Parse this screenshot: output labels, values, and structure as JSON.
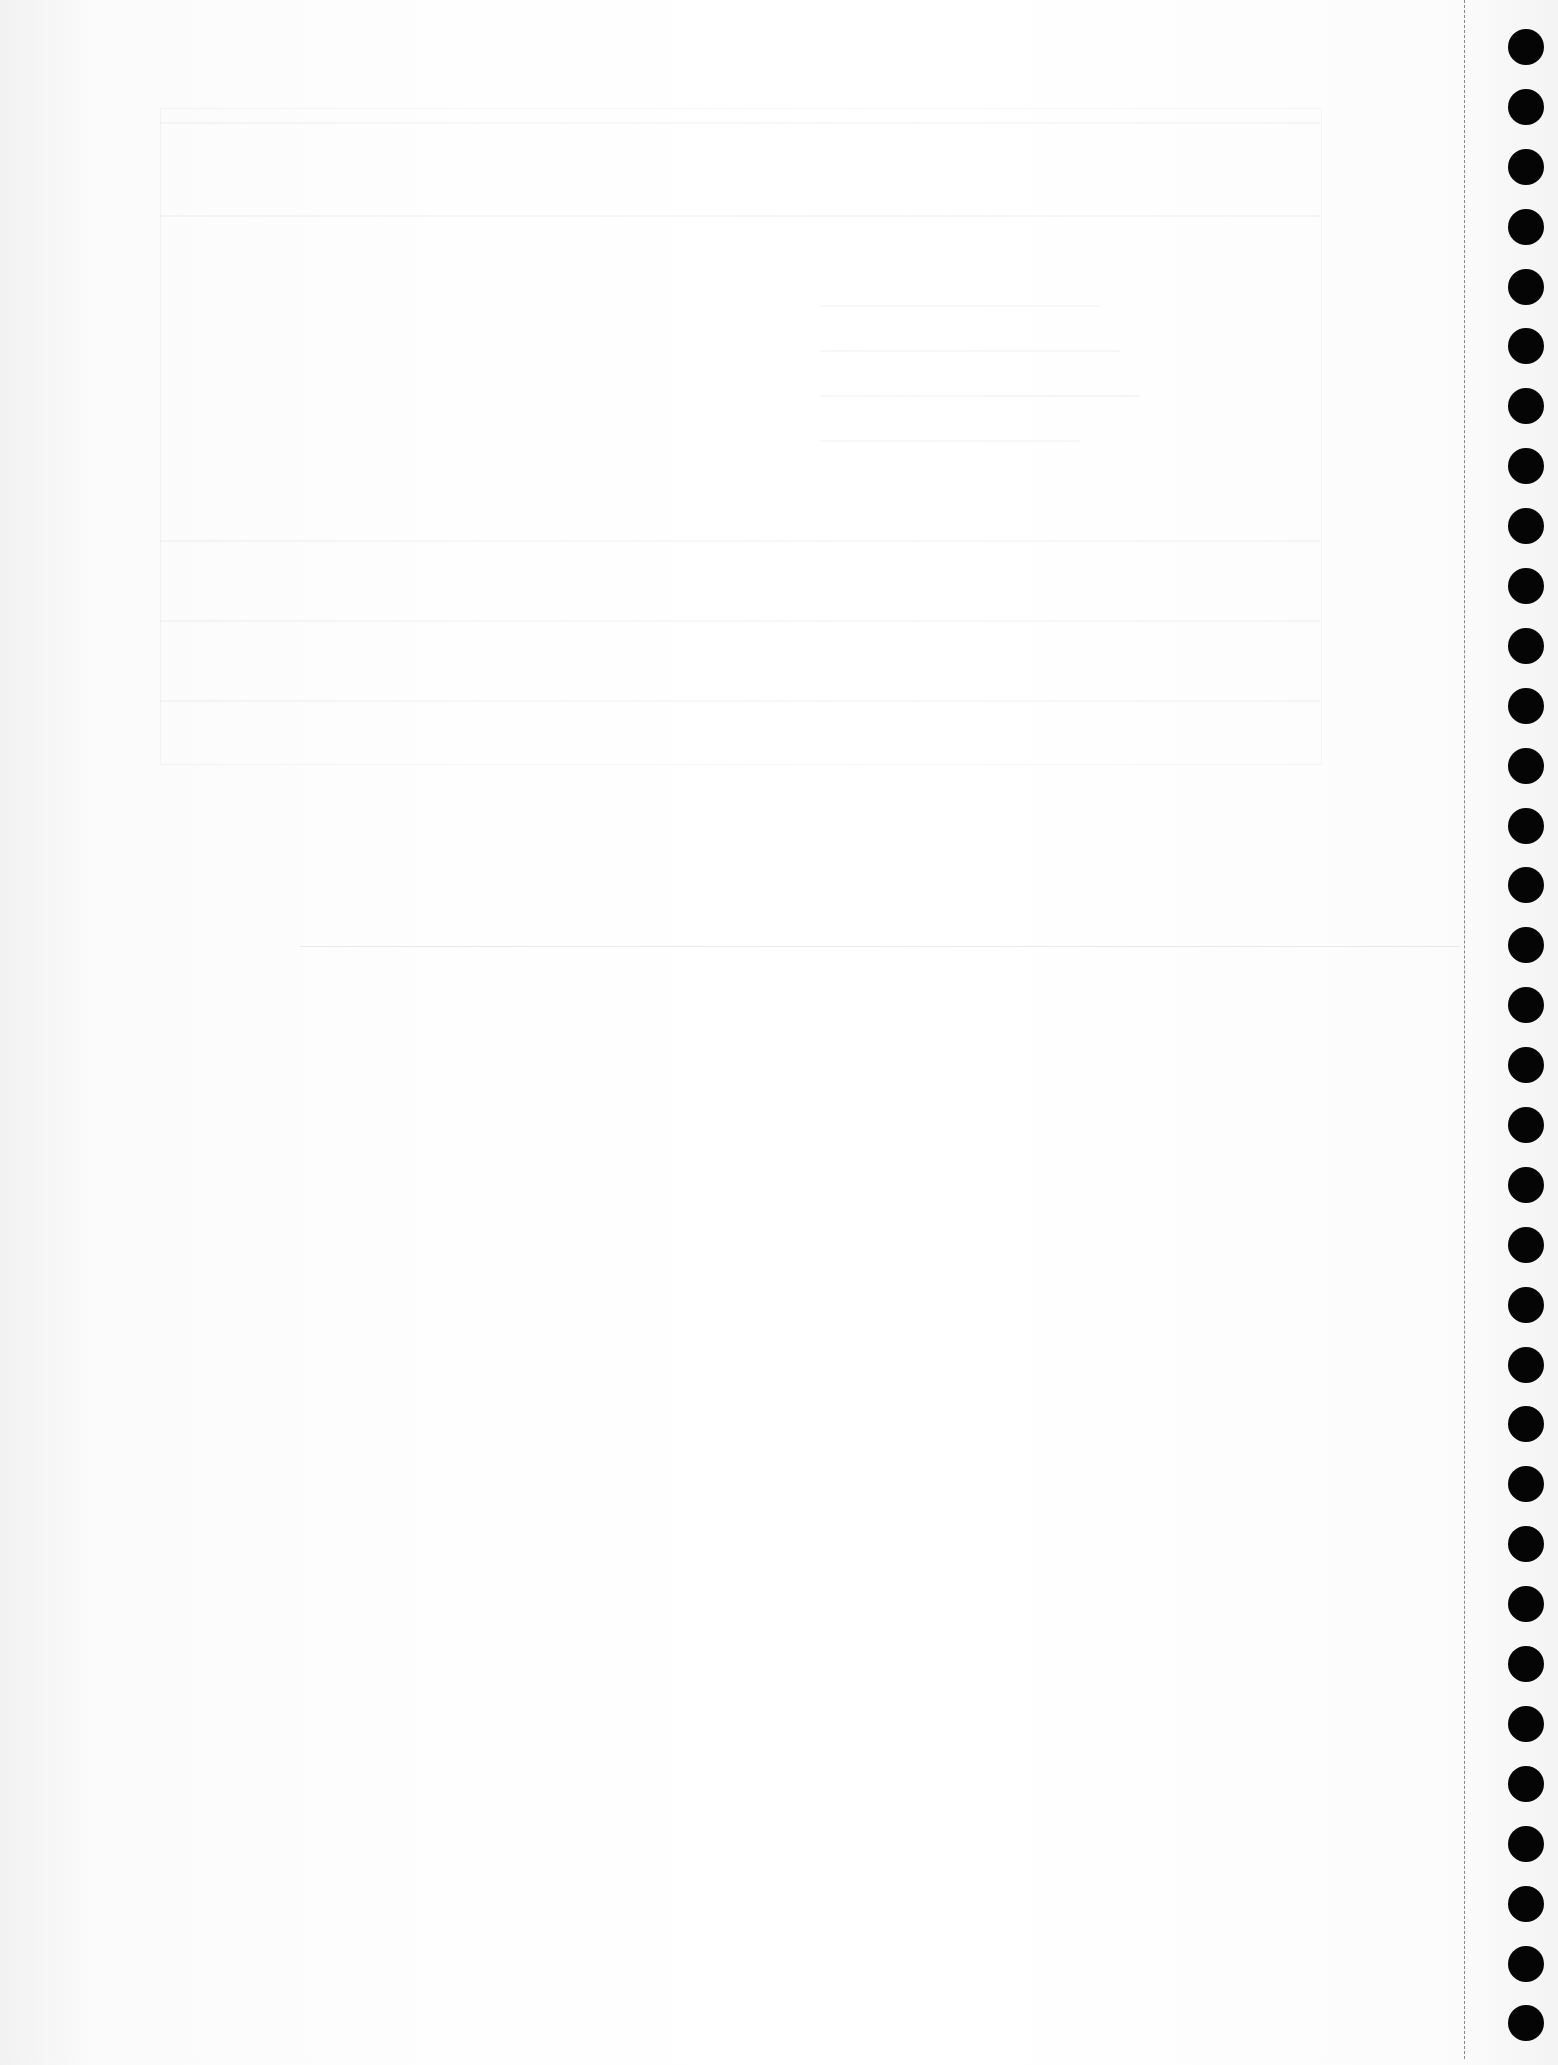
{
  "document": {
    "type": "scanned blank notebook page",
    "text_content": "",
    "bleed_through_text_legible": false
  },
  "binding": {
    "hole_count": 34,
    "hole_color": "#050505",
    "perforation_color": "#282828"
  },
  "colors": {
    "paper": "#fefefe",
    "edge_shade": "#f1f1f1"
  }
}
